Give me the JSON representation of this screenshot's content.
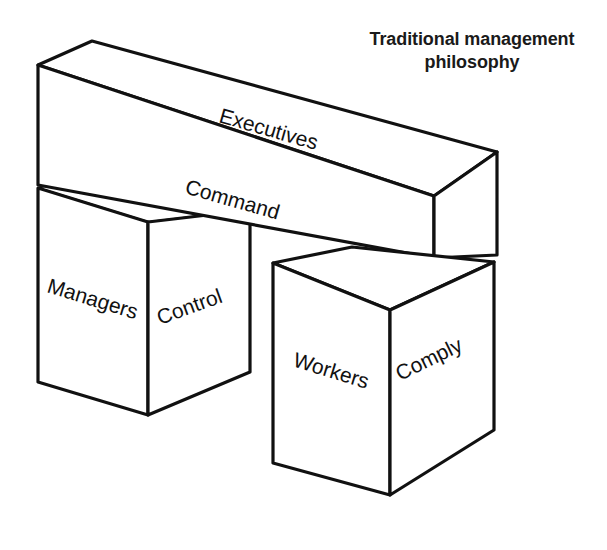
{
  "caption": {
    "line1": "Traditional management",
    "line2": "philosophy"
  },
  "diagram": {
    "type": "isometric-3d-blocks",
    "title": "Traditional management philosophy",
    "stroke_color": "#111111",
    "fill_color": "#ffffff",
    "background_color": "#ffffff",
    "blocks": [
      {
        "id": "executives-bar",
        "role_label": "Executives",
        "action_label": "Command",
        "shape": "long horizontal beam",
        "level": "top"
      },
      {
        "id": "managers-box",
        "role_label": "Managers",
        "action_label": "Control",
        "shape": "cube",
        "level": "middle-left"
      },
      {
        "id": "workers-box",
        "role_label": "Workers",
        "action_label": "Comply",
        "shape": "cube",
        "level": "bottom-right"
      }
    ]
  }
}
